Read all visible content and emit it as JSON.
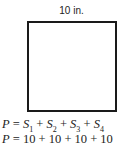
{
  "diagram": {
    "shape": "square",
    "side_label": "10 in.",
    "equations": [
      {
        "lhs": "P",
        "terms": [
          "S1",
          "S2",
          "S3",
          "S4"
        ]
      },
      {
        "lhs": "P",
        "rhs": "10 + 10 + 10 + 10"
      }
    ],
    "eq1": {
      "lhs": "P",
      "eq": " = ",
      "s": "S",
      "sub1": "1",
      "sub2": "2",
      "sub3": "3",
      "sub4": "4",
      "plus": " + "
    },
    "eq2": {
      "lhs": "P",
      "eq": " = ",
      "rhs": "10 + 10 + 10 + 10"
    }
  }
}
